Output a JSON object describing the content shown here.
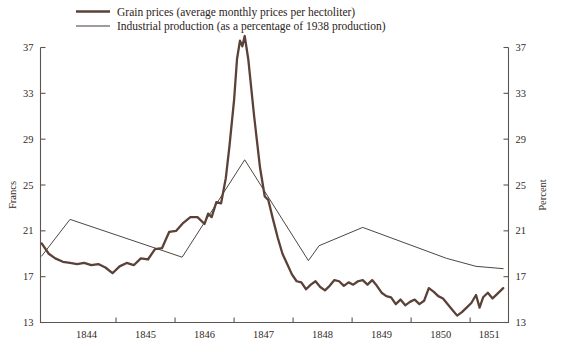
{
  "legend": {
    "position": "top-left",
    "items": [
      {
        "label": "Grain prices (average monthly prices per hectoliter)",
        "color": "#5b4138",
        "style": "thick"
      },
      {
        "label": "Industrial production (as a percentage of 1938 production)",
        "color": "#453b35",
        "style": "thin"
      }
    ]
  },
  "axes": {
    "left_title": "Francs",
    "right_title": "Percent",
    "left_ticks": [
      "13",
      "17",
      "21",
      "25",
      "29",
      "33",
      "37"
    ],
    "right_ticks": [
      "13",
      "17",
      "21",
      "25",
      "29",
      "33",
      "37"
    ],
    "x_ticks": [
      "1844",
      "1845",
      "1846",
      "1847",
      "1848",
      "1849",
      "1850",
      "1851"
    ]
  },
  "chart_data": {
    "type": "line",
    "title": "",
    "xlabel": "",
    "ylabel": "Francs",
    "y2label": "Percent",
    "grid": false,
    "legend_position": "top-left",
    "xlim": [
      1843.72,
      1851.65
    ],
    "ylim": [
      13,
      37
    ],
    "y2lim": [
      13,
      37
    ],
    "xticks": [
      1844,
      1845,
      1846,
      1847,
      1848,
      1849,
      1850,
      1851
    ],
    "yticks": [
      13,
      17,
      21,
      25,
      29,
      33,
      37
    ],
    "series": [
      {
        "name": "Grain prices (average monthly prices per hectoliter)",
        "color": "#5b4138",
        "axis": "left",
        "units": "francs per hectoliter",
        "points": [
          [
            1843.74,
            19.9
          ],
          [
            1843.86,
            19.0
          ],
          [
            1843.97,
            18.6
          ],
          [
            1844.1,
            18.3
          ],
          [
            1844.22,
            18.2
          ],
          [
            1844.34,
            18.1
          ],
          [
            1844.46,
            18.2
          ],
          [
            1844.58,
            18.0
          ],
          [
            1844.7,
            18.1
          ],
          [
            1844.82,
            17.8
          ],
          [
            1844.94,
            17.3
          ],
          [
            1845.06,
            17.9
          ],
          [
            1845.18,
            18.2
          ],
          [
            1845.3,
            18.0
          ],
          [
            1845.42,
            18.6
          ],
          [
            1845.54,
            18.5
          ],
          [
            1845.66,
            19.4
          ],
          [
            1845.78,
            19.5
          ],
          [
            1845.9,
            20.9
          ],
          [
            1846.02,
            21.0
          ],
          [
            1846.14,
            21.7
          ],
          [
            1846.26,
            22.2
          ],
          [
            1846.38,
            22.2
          ],
          [
            1846.5,
            21.6
          ],
          [
            1846.56,
            22.5
          ],
          [
            1846.62,
            22.2
          ],
          [
            1846.7,
            23.5
          ],
          [
            1846.78,
            23.4
          ],
          [
            1846.86,
            25.6
          ],
          [
            1846.92,
            28.3
          ],
          [
            1847.0,
            32.4
          ],
          [
            1847.05,
            36.0
          ],
          [
            1847.1,
            37.6
          ],
          [
            1847.14,
            37.1
          ],
          [
            1847.18,
            38.0
          ],
          [
            1847.24,
            36.0
          ],
          [
            1847.34,
            31.0
          ],
          [
            1847.44,
            26.5
          ],
          [
            1847.52,
            24.0
          ],
          [
            1847.58,
            23.7
          ],
          [
            1847.66,
            22.0
          ],
          [
            1847.74,
            20.4
          ],
          [
            1847.82,
            19.0
          ],
          [
            1847.9,
            18.1
          ],
          [
            1847.98,
            17.2
          ],
          [
            1848.06,
            16.6
          ],
          [
            1848.14,
            16.5
          ],
          [
            1848.22,
            15.9
          ],
          [
            1848.3,
            16.3
          ],
          [
            1848.38,
            16.6
          ],
          [
            1848.46,
            16.1
          ],
          [
            1848.54,
            15.8
          ],
          [
            1848.62,
            16.2
          ],
          [
            1848.7,
            16.7
          ],
          [
            1848.78,
            16.6
          ],
          [
            1848.86,
            16.2
          ],
          [
            1848.94,
            16.5
          ],
          [
            1849.02,
            16.3
          ],
          [
            1849.1,
            16.6
          ],
          [
            1849.18,
            16.7
          ],
          [
            1849.26,
            16.3
          ],
          [
            1849.34,
            16.7
          ],
          [
            1849.42,
            16.2
          ],
          [
            1849.5,
            15.6
          ],
          [
            1849.58,
            15.3
          ],
          [
            1849.66,
            15.2
          ],
          [
            1849.74,
            14.6
          ],
          [
            1849.82,
            15.0
          ],
          [
            1849.9,
            14.5
          ],
          [
            1849.98,
            14.8
          ],
          [
            1850.06,
            15.0
          ],
          [
            1850.14,
            14.6
          ],
          [
            1850.22,
            14.9
          ],
          [
            1850.3,
            16.0
          ],
          [
            1850.38,
            15.7
          ],
          [
            1850.46,
            15.3
          ],
          [
            1850.54,
            15.1
          ],
          [
            1850.62,
            14.6
          ],
          [
            1850.7,
            14.1
          ],
          [
            1850.78,
            13.6
          ],
          [
            1850.86,
            13.9
          ],
          [
            1850.94,
            14.3
          ],
          [
            1851.02,
            14.7
          ],
          [
            1851.1,
            15.4
          ],
          [
            1851.16,
            14.3
          ],
          [
            1851.22,
            15.2
          ],
          [
            1851.3,
            15.6
          ],
          [
            1851.38,
            15.1
          ],
          [
            1851.46,
            15.5
          ],
          [
            1851.56,
            16.0
          ]
        ]
      },
      {
        "name": "Industrial production (as a percentage of 1938 production)",
        "color": "#453b35",
        "axis": "right",
        "units": "percent of 1938 production",
        "points": [
          [
            1843.74,
            18.8
          ],
          [
            1844.22,
            22.0
          ],
          [
            1846.12,
            18.7
          ],
          [
            1847.18,
            27.2
          ],
          [
            1848.26,
            18.4
          ],
          [
            1848.44,
            19.7
          ],
          [
            1849.18,
            21.3
          ],
          [
            1850.6,
            18.6
          ],
          [
            1851.1,
            17.9
          ],
          [
            1851.56,
            17.7
          ]
        ]
      }
    ]
  }
}
